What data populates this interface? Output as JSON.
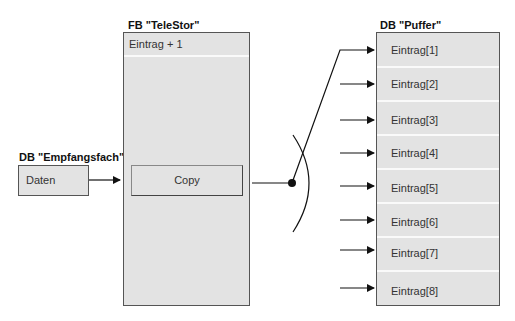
{
  "receiver_db": {
    "title": "DB \"Empfangsfach\"",
    "field": "Daten"
  },
  "function_block": {
    "title": "FB \"TeleStor\"",
    "counter_row": "Eintrag + 1",
    "action": "Copy"
  },
  "buffer_db": {
    "title": "DB \"Puffer\"",
    "entries": [
      "Eintrag[1]",
      "Eintrag[2]",
      "Eintrag[3]",
      "Eintrag[4]",
      "Eintrag[5]",
      "Eintrag[6]",
      "Eintrag[7]",
      "Eintrag[8]"
    ]
  },
  "colors": {
    "box_fill": "#e3e3e3",
    "border": "#555555",
    "line": "#111111"
  }
}
